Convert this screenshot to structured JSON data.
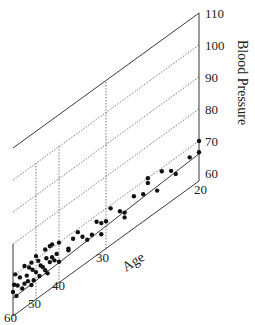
{
  "chart_data": {
    "type": "scatter",
    "title": "",
    "projection": "3d",
    "xlabel": "Age",
    "ylabel": "",
    "zlabel": "Blood Pressure",
    "age_ticks": [
      20,
      30,
      40,
      50,
      60
    ],
    "bp_ticks": [
      60,
      70,
      80,
      90,
      100,
      110
    ],
    "age_range": [
      20,
      60
    ],
    "bp_range": [
      60,
      110
    ],
    "grid": true,
    "regression_line": {
      "age_start": 60,
      "bp_start": 63,
      "age_end": 20,
      "bp_end": 66
    },
    "points": [
      [
        20,
        70
      ],
      [
        20,
        66.5
      ],
      [
        21,
        67
      ],
      [
        22.5,
        65
      ],
      [
        23,
        67
      ],
      [
        24,
        69
      ],
      [
        24.5,
        64
      ],
      [
        25.5,
        70
      ],
      [
        25.5,
        68.5
      ],
      [
        26,
        66
      ],
      [
        27,
        67.5
      ],
      [
        28,
        63
      ],
      [
        28,
        64.5
      ],
      [
        28.5,
        66
      ],
      [
        29.5,
        69
      ],
      [
        30,
        66
      ],
      [
        31,
        63
      ],
      [
        31,
        66.5
      ],
      [
        32,
        68
      ],
      [
        33,
        65
      ],
      [
        34,
        64.5
      ],
      [
        35,
        66.5
      ],
      [
        36,
        69
      ],
      [
        37,
        68
      ],
      [
        38,
        66
      ],
      [
        38,
        65.5
      ],
      [
        40,
        70
      ],
      [
        40,
        64
      ],
      [
        41,
        67
      ],
      [
        42,
        65.5
      ],
      [
        43,
        71
      ],
      [
        43,
        67
      ],
      [
        44,
        71
      ],
      [
        44,
        66
      ],
      [
        45,
        63
      ],
      [
        45.5,
        68
      ],
      [
        46,
        71
      ],
      [
        46,
        64.5
      ],
      [
        47,
        66
      ],
      [
        48,
        67
      ],
      [
        48.5,
        64
      ],
      [
        49,
        69
      ],
      [
        50,
        71
      ],
      [
        50,
        66
      ],
      [
        51,
        64
      ],
      [
        51.5,
        67.5
      ],
      [
        52,
        70
      ],
      [
        52,
        63
      ],
      [
        53,
        69
      ],
      [
        53.5,
        65
      ],
      [
        54,
        67
      ],
      [
        55,
        70.5
      ],
      [
        55,
        65
      ],
      [
        56,
        64
      ],
      [
        57,
        68
      ],
      [
        58,
        66
      ],
      [
        58.5,
        63
      ],
      [
        59,
        70
      ],
      [
        59.5,
        67
      ],
      [
        60,
        65
      ]
    ]
  }
}
